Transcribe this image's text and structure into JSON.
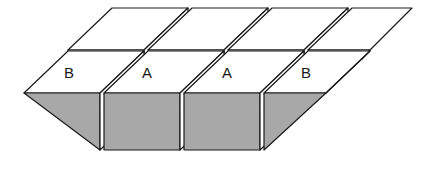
{
  "figure": {
    "name": "stepped-surface-diagram",
    "type": "isometric-3d-block-diagram",
    "background_color": "#ffffff",
    "line_color": "#1a1a1a",
    "face_top_color": "#ffffff",
    "face_front_color": "#a8a8a8",
    "line_width": 1.2,
    "labels": [
      {
        "text": "B",
        "x": 69,
        "y": 74
      },
      {
        "text": "A",
        "x": 147,
        "y": 74
      },
      {
        "text": "A",
        "x": 227,
        "y": 74
      },
      {
        "text": "B",
        "x": 306,
        "y": 74
      }
    ],
    "columns": [
      {
        "id": "col-1",
        "label": "B",
        "front_face_shape": "triangle"
      },
      {
        "id": "col-2",
        "label": "A",
        "front_face_shape": "rectangle"
      },
      {
        "id": "col-3",
        "label": "A",
        "front_face_shape": "rectangle"
      },
      {
        "id": "col-4",
        "label": "B",
        "front_face_shape": "triangle"
      }
    ],
    "geometry": {
      "depth_dx": 44,
      "depth_dy": -42,
      "column_width": 76,
      "gap": 4,
      "slab_thickness": 9,
      "front_block_height": 57,
      "origin_x": 24,
      "origin_y": 93
    }
  }
}
